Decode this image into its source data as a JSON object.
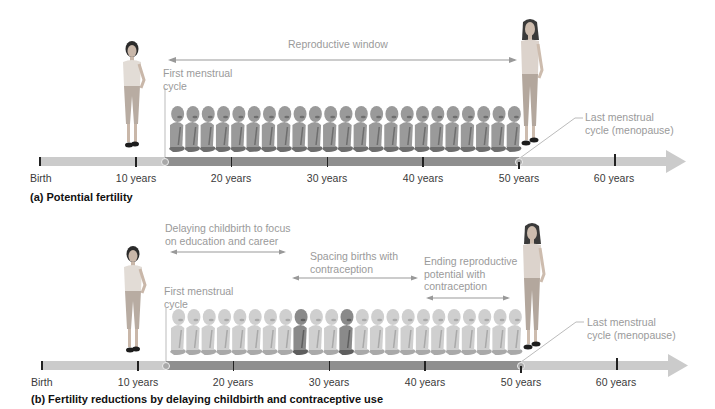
{
  "panels": [
    {
      "id": "a",
      "caption": "(a) Potential fertility",
      "ticks": [
        {
          "label": "Birth",
          "x": 40
        },
        {
          "label": "10 years",
          "x": 136
        },
        {
          "label": "20 years",
          "x": 231
        },
        {
          "label": "30 years",
          "x": 327
        },
        {
          "label": "40 years",
          "x": 423
        },
        {
          "label": "50 years",
          "x": 519
        },
        {
          "label": "60 years",
          "x": 614
        }
      ],
      "annotations": {
        "reproductive_window": "Reproductive window",
        "first_cycle_line1": "First menstrual",
        "first_cycle_line2": "cycle",
        "last_cycle_line1": "Last menstrual",
        "last_cycle_line2": "cycle (menopause)"
      },
      "baby_count": 23,
      "baby_tone": "dark"
    },
    {
      "id": "b",
      "caption": "(b) Fertility reductions by delaying childbirth and contraceptive use",
      "ticks": [
        {
          "label": "Birth",
          "x": 40
        },
        {
          "label": "10 years",
          "x": 136
        },
        {
          "label": "20 years",
          "x": 231
        },
        {
          "label": "30 years",
          "x": 327
        },
        {
          "label": "40 years",
          "x": 423
        },
        {
          "label": "50 years",
          "x": 519
        },
        {
          "label": "60 years",
          "x": 614
        }
      ],
      "annotations": {
        "delaying_line1": "Delaying childbirth to focus",
        "delaying_line2": "on education and career",
        "spacing_line1": "Spacing births with",
        "spacing_line2": "contraception",
        "ending_line1": "Ending reproductive",
        "ending_line2": "potential with",
        "ending_line3": "contraception",
        "first_cycle_line1": "First menstrual",
        "first_cycle_line2": "cycle",
        "last_cycle_line1": "Last menstrual",
        "last_cycle_line2": "cycle (menopause)"
      },
      "baby_count": 23,
      "baby_tone": "light",
      "highlighted_babies": [
        8,
        11
      ]
    }
  ],
  "colors": {
    "bar_light": "#c9c9c9",
    "bar_dark": "#8f8f8f",
    "annotation_text": "#9a9a9a",
    "tick": "#222222"
  }
}
